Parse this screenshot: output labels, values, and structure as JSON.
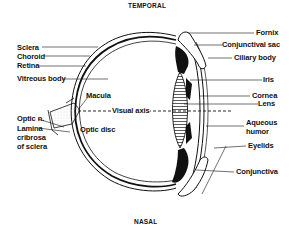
{
  "diagram": {
    "title_top": "TEMPORAL",
    "title_bottom": "NASAL",
    "left_labels": {
      "sclera": "Sclera",
      "choroid": "Choroid",
      "retina": "Retina",
      "vitreous_body": "Vitreous body",
      "macula": "Macula",
      "optic_n": "Optic n.",
      "lamina_1": "Lamina",
      "lamina_2": "cribrosa",
      "lamina_3": "of sclera",
      "optic_disc": "Optic disc",
      "visual_axis": "Visual axis"
    },
    "right_labels": {
      "fornix": "Fornix",
      "conjunctival_sac": "Conjunctival sac",
      "ciliary_body": "Ciliary body",
      "iris": "Iris",
      "cornea": "Cornea",
      "lens": "Lens",
      "aqueous_1": "Aqueous",
      "aqueous_2": "humor",
      "eyelids": "Eyelids",
      "conjunctiva": "Conjunctiva"
    }
  }
}
